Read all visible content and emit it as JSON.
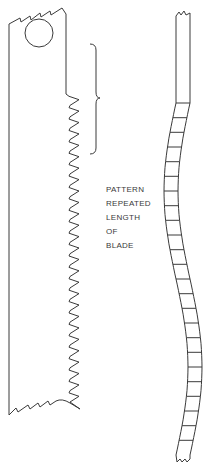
{
  "diagram": {
    "label_lines": [
      "PATTERN",
      "REPEATED",
      "LENGTH",
      "OF",
      "BLADE"
    ],
    "blade_teeth_count": 27,
    "side_view_segments": 24,
    "stroke_color": "#3a3a3a",
    "background": "#ffffff"
  }
}
